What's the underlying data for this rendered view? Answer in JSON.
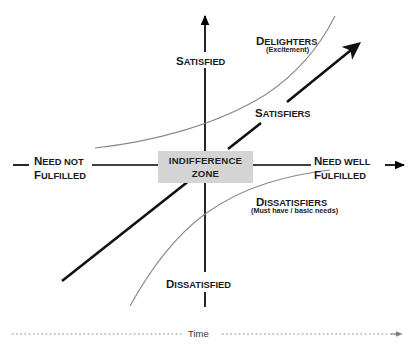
{
  "diagram": {
    "colors": {
      "axis": "#000000",
      "curve": "#808080",
      "thick_line": "#111111",
      "zone_fill": "#d4d4d4",
      "text": "#1a1a1a",
      "time_line": "#808080"
    },
    "axes": {
      "vertical_top_label": {
        "lead": "S",
        "rest": "ATISFIED"
      },
      "vertical_bottom_label": {
        "lead": "D",
        "rest": "ISSATISFIED"
      },
      "horizontal_left_label_line1": {
        "lead": "N",
        "rest": "EED NOT"
      },
      "horizontal_left_label_line2": {
        "lead": "F",
        "rest": "ULFILLED"
      },
      "horizontal_right_label_line1": {
        "lead": "N",
        "rest": "EED WELL"
      },
      "horizontal_right_label_line2": {
        "lead": "F",
        "rest": "ULFILLED"
      }
    },
    "center_zone": {
      "line1": "INDIFFERENCE",
      "line2": "ZONE"
    },
    "curves": [
      {
        "name": "delighters",
        "label": {
          "lead": "D",
          "rest": "ELIGHTERS"
        },
        "sublabel": "(Excitement)"
      },
      {
        "name": "satisfiers",
        "label": {
          "lead": "S",
          "rest": "ATISFIERS"
        },
        "sublabel": ""
      },
      {
        "name": "dissatisfiers",
        "label": {
          "lead": "D",
          "rest": "ISSATISFIERS"
        },
        "sublabel": "(Must have / basic needs)"
      }
    ],
    "time_axis": {
      "label": "Time"
    }
  }
}
